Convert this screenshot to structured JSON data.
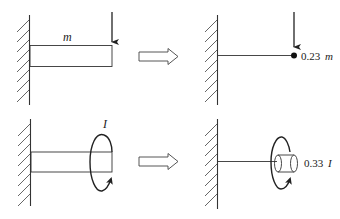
{
  "diagram": {
    "top_row": {
      "original": {
        "beam_label": "m",
        "load": "downward-force-arrow"
      },
      "equivalent": {
        "mass_coefficient": "0.23",
        "mass_symbol": "m",
        "load": "downward-force-arrow"
      }
    },
    "bottom_row": {
      "original": {
        "inertia_label": "I",
        "load": "rotational-moment-arrow"
      },
      "equivalent": {
        "inertia_coefficient": "0.33",
        "inertia_symbol": "I",
        "load": "rotational-moment-arrow"
      }
    },
    "transform_arrow": "hollow-right-arrow",
    "colors": {
      "line": "#2a2a2a",
      "hatch": "#555555",
      "background": "#ffffff"
    }
  }
}
